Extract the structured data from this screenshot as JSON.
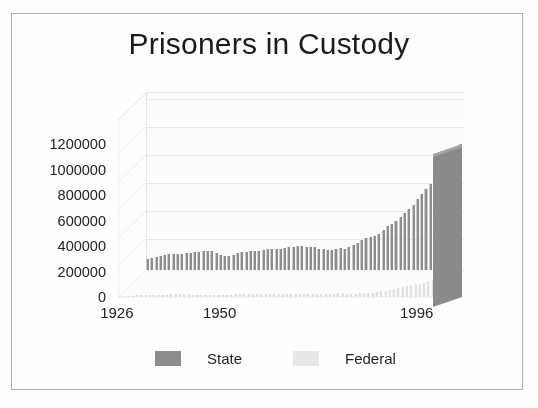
{
  "chart_data": {
    "type": "bar",
    "title": "Prisoners in Custody",
    "subtitle": "",
    "xlabel": "",
    "ylabel": "",
    "grid": true,
    "legend_position": "bottom",
    "three_d": true,
    "ylim": [
      0,
      1400000
    ],
    "yticks": [
      0,
      200000,
      400000,
      600000,
      800000,
      1000000,
      1200000
    ],
    "ytick_labels": [
      "0",
      "200000",
      "400000",
      "600000",
      "800000",
      "1000000",
      "1200000"
    ],
    "xtick_labels": [
      "1926",
      "1950",
      "1996"
    ],
    "xtick_years": [
      1926,
      1950,
      1996
    ],
    "x": [
      1926,
      1927,
      1928,
      1929,
      1930,
      1931,
      1932,
      1933,
      1934,
      1935,
      1936,
      1937,
      1938,
      1939,
      1940,
      1941,
      1942,
      1943,
      1944,
      1945,
      1946,
      1947,
      1948,
      1949,
      1950,
      1951,
      1952,
      1953,
      1954,
      1955,
      1956,
      1957,
      1958,
      1959,
      1960,
      1961,
      1962,
      1963,
      1964,
      1965,
      1966,
      1967,
      1968,
      1969,
      1970,
      1971,
      1972,
      1973,
      1974,
      1975,
      1976,
      1977,
      1978,
      1979,
      1980,
      1981,
      1982,
      1983,
      1984,
      1985,
      1986,
      1987,
      1988,
      1989,
      1990,
      1991,
      1992,
      1993,
      1994,
      1995,
      1996,
      1997,
      1998,
      1999
    ],
    "series": [
      {
        "name": "State",
        "color": "#8d8d8d",
        "values": [
          85000,
          94000,
          104000,
          112000,
          119000,
          126000,
          126000,
          125000,
          128000,
          131000,
          136000,
          138000,
          142000,
          150000,
          153000,
          146000,
          131000,
          119000,
          113000,
          110000,
          120000,
          134000,
          138000,
          144000,
          149000,
          150000,
          152000,
          155000,
          162000,
          165000,
          164000,
          166000,
          177000,
          182000,
          180000,
          186000,
          185000,
          182000,
          183000,
          178000,
          168000,
          163000,
          157000,
          160000,
          167000,
          170000,
          166000,
          181000,
          196000,
          216000,
          234000,
          250000,
          257000,
          269000,
          284000,
          315000,
          343000,
          363000,
          385000,
          420000,
          450000,
          477000,
          512000,
          560000,
          600000,
          640000,
          677000,
          714000,
          768000,
          819000,
          873000,
          912000,
          952000,
          990000
        ]
      },
      {
        "name": "Federal",
        "color": "#e9e9e9",
        "values": [
          7000,
          8000,
          9000,
          10000,
          12000,
          13000,
          14000,
          15000,
          16000,
          17000,
          18000,
          19000,
          20000,
          21000,
          22000,
          22000,
          20000,
          18000,
          17000,
          17000,
          18000,
          18000,
          18000,
          18000,
          17000,
          18000,
          19000,
          20000,
          20000,
          21000,
          21000,
          22000,
          23000,
          23000,
          23000,
          24000,
          24000,
          23000,
          22000,
          22000,
          21000,
          20000,
          20000,
          20000,
          21000,
          21000,
          22000,
          24000,
          24000,
          24000,
          27000,
          30000,
          29000,
          26000,
          24000,
          27000,
          29000,
          31000,
          33000,
          35000,
          38000,
          44000,
          50000,
          58000,
          65000,
          71000,
          80000,
          89000,
          95000,
          100000,
          106000,
          113000,
          123000,
          135000
        ]
      }
    ],
    "peak_total": 1125000,
    "peak_year": 1999
  },
  "legend": {
    "items": [
      {
        "label": "State",
        "swatch": "#8d8d8d"
      },
      {
        "label": "Federal",
        "swatch": "#e9e9e9"
      }
    ]
  },
  "frame": {
    "border_color": "#b9b9b9"
  }
}
